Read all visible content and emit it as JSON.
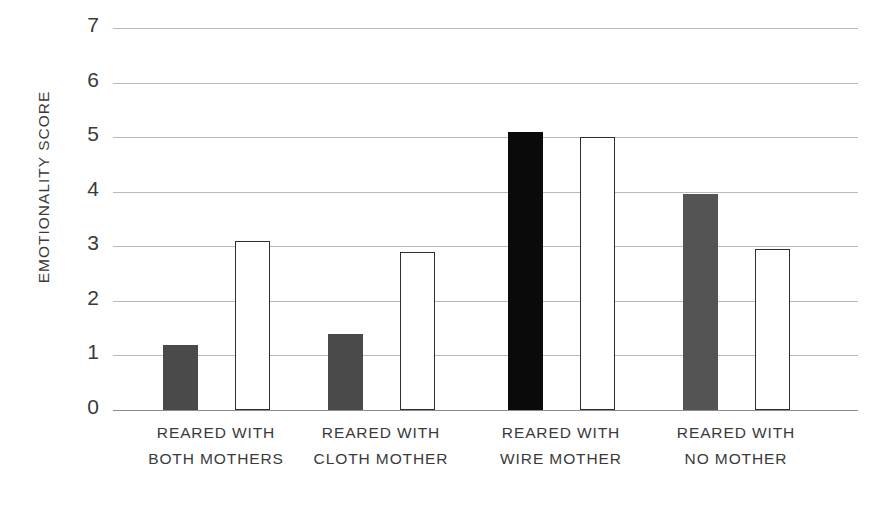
{
  "chart_data": {
    "type": "bar",
    "title": "",
    "xlabel": "",
    "ylabel": "EMOTIONALITY SCORE",
    "ylim": [
      0,
      7
    ],
    "ytick_labels": [
      "7",
      "6",
      "5",
      "4",
      "3",
      "2",
      "1",
      "0"
    ],
    "ytick_values": [
      7,
      6,
      5,
      4,
      3,
      2,
      1,
      0
    ],
    "grid": true,
    "legend": "none",
    "categories": [
      "REARED WITH BOTH MOTHERS",
      "REARED WITH CLOTH MOTHER",
      "REARED WITH WIRE MOTHER",
      "REARED WITH NO MOTHER"
    ],
    "category_lines": [
      [
        "REARED WITH",
        "BOTH MOTHERS"
      ],
      [
        "REARED WITH",
        "CLOTH MOTHER"
      ],
      [
        "REARED WITH",
        "WIRE MOTHER"
      ],
      [
        "REARED WITH",
        "NO MOTHER"
      ]
    ],
    "series": [
      {
        "name": "filled",
        "values": [
          1.2,
          1.4,
          5.1,
          3.95
        ],
        "fills": [
          "#4a4a4a",
          "#4a4a4a",
          "#0a0a0a",
          "#545454"
        ]
      },
      {
        "name": "outline",
        "values": [
          3.1,
          2.9,
          5.0,
          2.95
        ],
        "fills": [
          "#ffffff",
          "#ffffff",
          "#ffffff",
          "#ffffff"
        ]
      }
    ]
  },
  "colors": {
    "gridline": "#b9b9b9",
    "baseline": "#8d8d8d",
    "bar_dark": "#4a4a4a",
    "bar_black": "#0a0a0a",
    "bar_gray": "#545454",
    "bar_outline_stroke": "#2e2e2e",
    "text": "#3a3a3a",
    "background": "#ffffff"
  },
  "geometry": {
    "plot_left": 113,
    "plot_top": 28,
    "plot_width": 745,
    "plot_height": 382,
    "bar_width": 35,
    "filled_bar_centers": [
      180,
      345,
      525,
      700
    ],
    "outline_bar_centers": [
      252,
      417,
      597,
      772
    ],
    "group_label_centers": [
      216,
      381,
      561,
      736
    ]
  }
}
